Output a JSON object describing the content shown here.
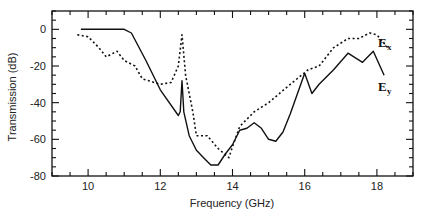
{
  "chart_data": {
    "type": "line",
    "title": "",
    "xlabel": "Frequency (GHz)",
    "ylabel": "Transmission (dB)",
    "xlim": [
      9,
      19
    ],
    "ylim": [
      -80,
      10
    ],
    "x_ticks": [
      10,
      12,
      14,
      16,
      18
    ],
    "y_ticks": [
      0,
      -20,
      -40,
      -60,
      -80
    ],
    "x_minor_step": 0.5,
    "y_minor_step": 5,
    "grid": false,
    "series": [
      {
        "name": "Ey",
        "label_main": "E",
        "label_sub": "y",
        "style": "solid",
        "color": "#111111",
        "x": [
          9.8,
          11.0,
          11.2,
          11.6,
          12.0,
          12.5,
          12.55,
          12.6,
          12.65,
          12.8,
          13.0,
          13.2,
          13.4,
          13.6,
          13.8,
          14.0,
          14.2,
          14.4,
          14.6,
          14.8,
          15.0,
          15.2,
          15.4,
          15.6,
          16.0,
          16.2,
          16.4,
          16.8,
          17.2,
          17.6,
          17.9,
          18.2
        ],
        "y": [
          0,
          0,
          -2,
          -17,
          -33,
          -47,
          -45,
          -28,
          -45,
          -58,
          -66,
          -70,
          -74,
          -74,
          -68,
          -63,
          -55,
          -54,
          -51,
          -54,
          -60,
          -61,
          -56,
          -46,
          -24,
          -35,
          -30,
          -22,
          -13,
          -18,
          -12,
          -25
        ]
      },
      {
        "name": "Ex",
        "label_main": "E",
        "label_sub": "x",
        "style": "dotted",
        "color": "#111111",
        "x": [
          9.7,
          10.0,
          10.3,
          10.5,
          10.8,
          11.0,
          11.3,
          11.5,
          12.0,
          12.3,
          12.5,
          12.6,
          12.7,
          12.9,
          13.0,
          13.3,
          13.6,
          13.9,
          14.0,
          14.2,
          14.6,
          15.0,
          15.6,
          16.1,
          16.4,
          16.8,
          17.2,
          17.5,
          17.8,
          18.0,
          18.3
        ],
        "y": [
          -3,
          -4,
          -10,
          -15,
          -12,
          -17,
          -20,
          -27,
          -30,
          -29,
          -20,
          -3,
          -25,
          -45,
          -58,
          -58,
          -65,
          -70,
          -64,
          -53,
          -45,
          -40,
          -30,
          -22,
          -20,
          -10,
          -5,
          -5,
          -2,
          -3,
          -10
        ]
      }
    ],
    "legend": "inline-right"
  }
}
